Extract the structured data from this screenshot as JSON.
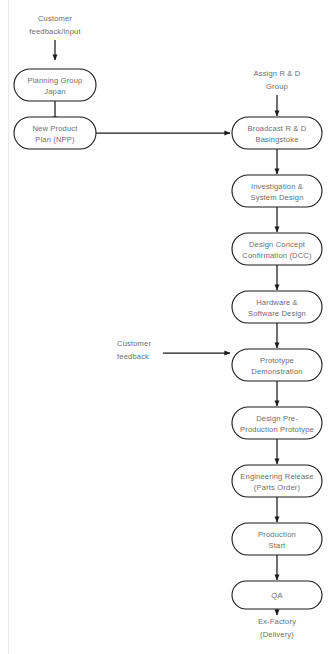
{
  "diagram": {
    "colors": {
      "background": "#ffffff",
      "node_stroke": "#1b1b1b",
      "node_fill": "#ffffff",
      "text": "#6e6e6e",
      "connector": "#1b1b1b"
    },
    "free_labels": [
      {
        "id": "customer-feedback-input",
        "line1": "Customer",
        "line2": "feedback/input"
      },
      {
        "id": "assign-rd-group",
        "line1": "Assign R & D",
        "line2": "Group"
      },
      {
        "id": "customer-feedback",
        "line1": "Customer",
        "line2": "feedback"
      },
      {
        "id": "ex-factory-delivery",
        "line1": "Ex-Factory",
        "line2": "(Delivery)"
      }
    ],
    "nodes": [
      {
        "id": "planning-group-japan",
        "line1": "Planning Group",
        "line2": "Japan",
        "column": "left"
      },
      {
        "id": "new-product-plan",
        "line1": "New Product",
        "line2": "Plan (NPP)",
        "column": "left"
      },
      {
        "id": "broadcast-rd-basingstoke",
        "line1": "Broadcast R & D",
        "line2": "Basingstoke",
        "column": "right"
      },
      {
        "id": "investigation-system-design",
        "line1": "Investigation &",
        "line2": "System Design",
        "column": "right"
      },
      {
        "id": "design-concept-confirmation",
        "line1": "Design Concept",
        "line2": "Confirmation (DCC)",
        "column": "right"
      },
      {
        "id": "hardware-software-design",
        "line1": "Hardware &",
        "line2": "Software Design",
        "column": "right"
      },
      {
        "id": "prototype-demonstration",
        "line1": "Prototype",
        "line2": "Demonstration",
        "column": "right"
      },
      {
        "id": "design-pre-production-prototype",
        "line1": "Design Pre-",
        "line2": "Production Prototype",
        "column": "right"
      },
      {
        "id": "engineering-release",
        "line1": "Engineering Release",
        "line2": "(Parts Order)",
        "column": "right"
      },
      {
        "id": "production-start",
        "line1": "Production",
        "line2": "Start",
        "column": "right"
      },
      {
        "id": "qa",
        "line1": "QA",
        "line2": "",
        "column": "right"
      }
    ],
    "edges": [
      {
        "id": "edge-customer-input-to-planning",
        "from": "customer-feedback-input",
        "to": "planning-group-japan",
        "kind": "vertical-arrow"
      },
      {
        "id": "edge-planning-to-npp",
        "from": "planning-group-japan",
        "to": "new-product-plan",
        "kind": "vertical-arrow"
      },
      {
        "id": "edge-npp-to-broadcast",
        "from": "new-product-plan",
        "to": "broadcast-rd-basingstoke",
        "kind": "horizontal-arrow"
      },
      {
        "id": "edge-assign-to-broadcast",
        "from": "assign-rd-group",
        "to": "broadcast-rd-basingstoke",
        "kind": "vertical-arrow"
      },
      {
        "id": "edge-broadcast-to-investigation",
        "from": "broadcast-rd-basingstoke",
        "to": "investigation-system-design",
        "kind": "vertical-arrow"
      },
      {
        "id": "edge-investigation-to-dcc",
        "from": "investigation-system-design",
        "to": "design-concept-confirmation",
        "kind": "vertical-arrow"
      },
      {
        "id": "edge-dcc-to-hardware",
        "from": "design-concept-confirmation",
        "to": "hardware-software-design",
        "kind": "vertical-arrow"
      },
      {
        "id": "edge-hardware-to-prototype",
        "from": "hardware-software-design",
        "to": "prototype-demonstration",
        "kind": "vertical-arrow"
      },
      {
        "id": "edge-customer-feedback-to-prototype",
        "from": "customer-feedback",
        "to": "prototype-demonstration",
        "kind": "horizontal-arrow"
      },
      {
        "id": "edge-prototype-to-preproduction",
        "from": "prototype-demonstration",
        "to": "design-pre-production-prototype",
        "kind": "vertical-arrow"
      },
      {
        "id": "edge-preproduction-to-engineering",
        "from": "design-pre-production-prototype",
        "to": "engineering-release",
        "kind": "vertical-arrow"
      },
      {
        "id": "edge-engineering-to-production",
        "from": "engineering-release",
        "to": "production-start",
        "kind": "vertical-arrow"
      },
      {
        "id": "edge-production-to-qa",
        "from": "production-start",
        "to": "qa",
        "kind": "vertical-arrow"
      },
      {
        "id": "edge-qa-to-exfactory",
        "from": "qa",
        "to": "ex-factory-delivery",
        "kind": "vertical-arrow"
      }
    ]
  }
}
